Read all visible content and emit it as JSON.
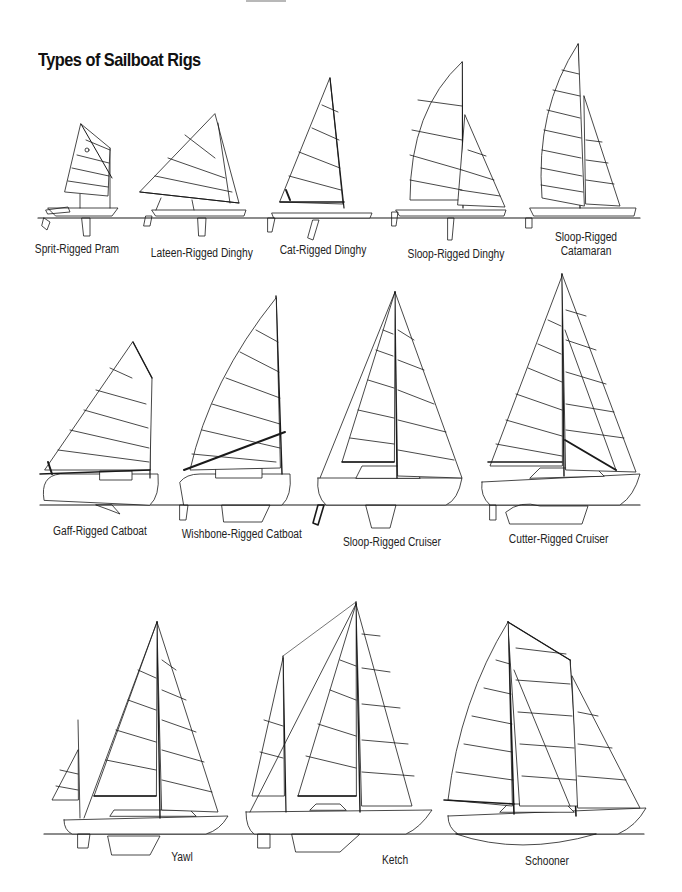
{
  "page": {
    "title": "Types of Sailboat Rigs"
  },
  "rows": [
    {
      "boats": [
        {
          "label": "Sprit-Rigged Pram"
        },
        {
          "label": "Lateen-Rigged Dinghy"
        },
        {
          "label": "Cat-Rigged Dinghy"
        },
        {
          "label": "Sloop-Rigged Dinghy"
        },
        {
          "label_line1": "Sloop-Rigged",
          "label_line2": "Catamaran"
        }
      ]
    },
    {
      "boats": [
        {
          "label": "Gaff-Rigged Catboat"
        },
        {
          "label": "Wishbone-Rigged Catboat"
        },
        {
          "label": "Sloop-Rigged Cruiser"
        },
        {
          "label": "Cutter-Rigged Cruiser"
        }
      ]
    },
    {
      "boats": [
        {
          "label": "Yawl"
        },
        {
          "label": "Ketch"
        },
        {
          "label": "Schooner"
        }
      ]
    }
  ],
  "colors": {
    "line": "#1a1a1a",
    "background": "#ffffff"
  }
}
